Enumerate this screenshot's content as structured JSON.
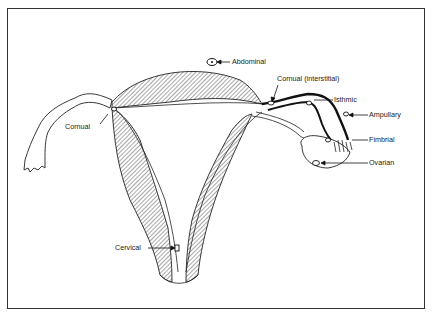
{
  "diagram": {
    "labels": {
      "abdominal": "Abdominal",
      "cornual_interstitial": "Cornual (interstitial)",
      "isthmic": "Isthmic",
      "ampullary": "Ampullary",
      "fimbrial": "Fimbrial",
      "ovarian": "Ovarian",
      "cornual": "Cornual",
      "cervical": "Cervical"
    },
    "colors": {
      "line": "#1a1a1a",
      "background": "#ffffff",
      "frame": "#333333"
    }
  }
}
